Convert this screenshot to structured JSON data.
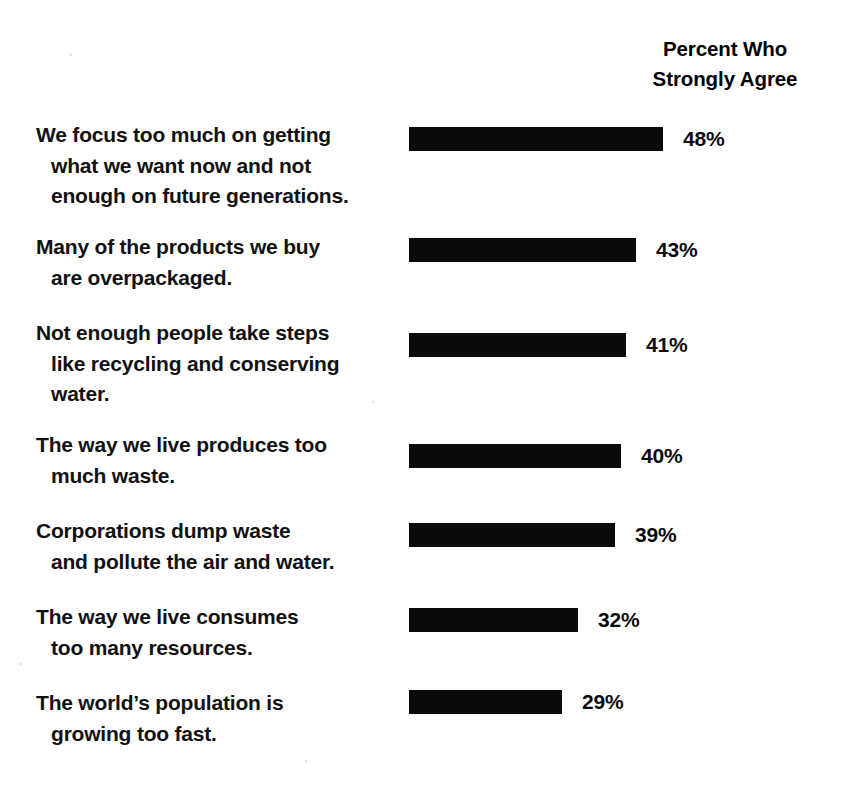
{
  "header": {
    "line1": "Percent Who",
    "line2": "Strongly Agree"
  },
  "chart_data": {
    "type": "bar",
    "orientation": "horizontal",
    "title": "",
    "subtitle": "",
    "xlabel": "",
    "ylabel": "",
    "value_suffix": "%",
    "value_header": "Percent Who Strongly Agree",
    "grid": false,
    "legend": null,
    "xlim": [
      0,
      48
    ],
    "categories": [
      "We focus too much on getting what we want now and not enough on future generations.",
      "Many of the products we buy are overpackaged.",
      "Not enough people take steps like recycling and conserving water.",
      "The way we live produces too much waste.",
      "Corporations dump waste and pollute the air and water.",
      "The way we live consumes too many resources.",
      "The world's population is growing too fast."
    ],
    "values": [
      48,
      43,
      41,
      40,
      39,
      32,
      29
    ],
    "value_labels": [
      "48%",
      "43%",
      "41%",
      "40%",
      "39%",
      "32%",
      "29%"
    ],
    "bar_color": "#0a0a0a",
    "background_color": "#ffffff"
  },
  "rows": [
    {
      "lines": [
        "We focus too much on getting",
        "what we want now and not",
        "enough on future generations."
      ],
      "value": 48,
      "value_label": "48%"
    },
    {
      "lines": [
        "Many of the products we buy",
        "are overpackaged."
      ],
      "value": 43,
      "value_label": "43%"
    },
    {
      "lines": [
        "Not enough people take steps",
        "like recycling and conserving",
        "water."
      ],
      "value": 41,
      "value_label": "41%"
    },
    {
      "lines": [
        "The way we live produces too",
        "much waste."
      ],
      "value": 40,
      "value_label": "40%"
    },
    {
      "lines": [
        "Corporations dump waste",
        "and pollute the air and water."
      ],
      "value": 39,
      "value_label": "39%"
    },
    {
      "lines": [
        "The way we live consumes",
        "too many resources."
      ],
      "value": 32,
      "value_label": "32%"
    },
    {
      "lines": [
        "The world’s population is",
        "growing too fast."
      ],
      "value": 29,
      "value_label": "29%"
    }
  ],
  "layout": {
    "row_tops": [
      120,
      232,
      318,
      430,
      516,
      602,
      688
    ],
    "bar_tops": [
      127,
      238,
      333,
      444,
      523,
      608,
      690
    ],
    "px_per_percent": 5.29
  }
}
